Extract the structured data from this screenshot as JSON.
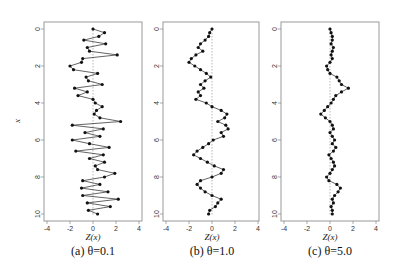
{
  "figure": {
    "ylabel": "x",
    "xlabel": "Z(x)",
    "panels": [
      {
        "caption": "(a) θ=0.1",
        "theta": "0.1"
      },
      {
        "caption": "(b) θ=1.0",
        "theta": "1.0"
      },
      {
        "caption": "(c) θ=5.0",
        "theta": "5.0"
      }
    ],
    "xticks": [
      "-4",
      "-2",
      "0",
      "2",
      "4"
    ],
    "yticks": [
      "0",
      "2",
      "4",
      "6",
      "8",
      "10"
    ]
  },
  "chart_data": [
    {
      "type": "line",
      "title": "(a) θ=0.1",
      "xlabel": "Z(x)",
      "ylabel": "x",
      "xlim": [
        -4,
        4
      ],
      "ylim": [
        10,
        0
      ],
      "orientation": "x values on vertical axis (0 top to 10 bottom), Z(x) on horizontal axis",
      "grid": false,
      "reference_line": "dashed vertical at Z=0",
      "x": [
        0.0,
        0.2,
        0.4,
        0.6,
        0.8,
        1.0,
        1.2,
        1.4,
        1.6,
        1.8,
        2.0,
        2.2,
        2.4,
        2.6,
        2.8,
        3.0,
        3.2,
        3.4,
        3.6,
        3.8,
        4.0,
        4.2,
        4.4,
        4.6,
        4.8,
        5.0,
        5.2,
        5.4,
        5.6,
        5.8,
        6.0,
        6.2,
        6.4,
        6.6,
        6.8,
        7.0,
        7.2,
        7.4,
        7.6,
        7.8,
        8.0,
        8.2,
        8.4,
        8.6,
        8.8,
        9.0,
        9.2,
        9.4,
        9.6,
        9.8,
        10.0
      ],
      "Z": [
        0.0,
        1.0,
        0.5,
        -0.8,
        1.1,
        -0.5,
        -0.3,
        2.1,
        -0.9,
        -1.0,
        -2.0,
        -1.7,
        0.4,
        -0.6,
        -0.4,
        0.8,
        -1.6,
        -0.5,
        -1.3,
        0.0,
        0.2,
        0.8,
        0.3,
        0.1,
        0.6,
        2.4,
        -1.8,
        0.9,
        -0.7,
        0.6,
        -1.8,
        -0.3,
        1.4,
        -1.5,
        0.9,
        -0.3,
        1.0,
        0.2,
        0.4,
        1.9,
        1.0,
        -0.9,
        0.6,
        -1.0,
        1.3,
        -0.9,
        2.2,
        -0.5,
        1.5,
        -0.4,
        0.4
      ],
      "note": "θ=0.1 series is approximate; values sampled visually at Δx≈0.2 (plot contains ~100 points)"
    },
    {
      "type": "line",
      "title": "(b) θ=1.0",
      "xlabel": "Z(x)",
      "ylabel": "x",
      "xlim": [
        -4,
        4
      ],
      "ylim": [
        10,
        0
      ],
      "x": [
        0.0,
        0.2,
        0.4,
        0.6,
        0.8,
        1.0,
        1.2,
        1.4,
        1.6,
        1.8,
        2.0,
        2.2,
        2.4,
        2.6,
        2.8,
        3.0,
        3.2,
        3.4,
        3.6,
        3.8,
        4.0,
        4.2,
        4.4,
        4.6,
        4.8,
        5.0,
        5.2,
        5.4,
        5.6,
        5.8,
        6.0,
        6.2,
        6.4,
        6.6,
        6.8,
        7.0,
        7.2,
        7.4,
        7.6,
        7.8,
        8.0,
        8.2,
        8.4,
        8.6,
        8.8,
        9.0,
        9.2,
        9.4,
        9.6,
        9.8,
        10.0
      ],
      "Z": [
        0.0,
        -0.2,
        -0.3,
        -0.6,
        -1.0,
        -1.2,
        -0.8,
        -1.4,
        -1.8,
        -2.0,
        -1.5,
        -1.0,
        -0.5,
        -0.1,
        -0.6,
        -1.0,
        -0.7,
        -1.2,
        -1.0,
        -1.4,
        -0.5,
        0.0,
        0.8,
        1.3,
        1.1,
        0.5,
        1.2,
        1.4,
        0.8,
        1.0,
        0.1,
        -0.3,
        -0.8,
        -1.3,
        -1.6,
        -1.0,
        -0.4,
        0.2,
        1.0,
        0.8,
        0.0,
        -1.0,
        -1.3,
        -1.0,
        -0.6,
        0.0,
        0.8,
        0.5,
        0.3,
        -0.2,
        -0.3
      ],
      "note": "approximate, sampled visually"
    },
    {
      "type": "line",
      "title": "(c) θ=5.0",
      "xlabel": "Z(x)",
      "ylabel": "x",
      "xlim": [
        -4,
        4
      ],
      "ylim": [
        10,
        0
      ],
      "x": [
        0.0,
        0.2,
        0.4,
        0.6,
        0.8,
        1.0,
        1.2,
        1.4,
        1.6,
        1.8,
        2.0,
        2.2,
        2.4,
        2.6,
        2.8,
        3.0,
        3.2,
        3.4,
        3.6,
        3.8,
        4.0,
        4.2,
        4.4,
        4.6,
        4.8,
        5.0,
        5.2,
        5.4,
        5.6,
        5.8,
        6.0,
        6.2,
        6.4,
        6.6,
        6.8,
        7.0,
        7.2,
        7.4,
        7.6,
        7.8,
        8.0,
        8.2,
        8.4,
        8.6,
        8.8,
        9.0,
        9.2,
        9.4,
        9.6,
        9.8,
        10.0
      ],
      "Z": [
        0.0,
        0.1,
        0.2,
        0.2,
        0.1,
        0.3,
        0.2,
        0.1,
        0.2,
        0.0,
        -0.3,
        -0.2,
        0.0,
        0.6,
        0.8,
        1.0,
        1.6,
        1.0,
        0.5,
        0.3,
        0.1,
        -0.2,
        -0.5,
        -0.8,
        -0.4,
        0.0,
        0.2,
        0.3,
        0.0,
        0.2,
        0.4,
        0.2,
        0.5,
        0.3,
        -0.1,
        0.1,
        0.3,
        0.4,
        0.2,
        0.0,
        -0.3,
        -0.1,
        0.6,
        0.9,
        0.7,
        0.4,
        0.2,
        0.3,
        0.1,
        0.2,
        0.2
      ],
      "note": "approximate, sampled visually"
    }
  ]
}
